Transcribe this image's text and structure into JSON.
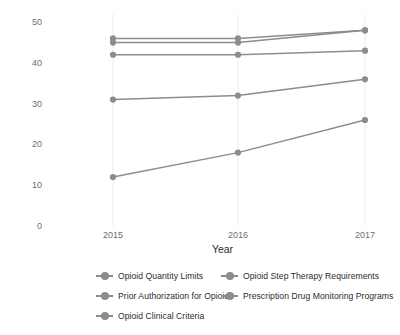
{
  "chart_data": {
    "type": "line",
    "title": "",
    "xlabel": "Year",
    "ylabel": "Number of states adopting policy",
    "x": [
      2015,
      2016,
      2017
    ],
    "xtick_labels": [
      "2015",
      "2016",
      "2017"
    ],
    "ytick_labels": [
      "0",
      "10",
      "20",
      "30",
      "40",
      "50"
    ],
    "ytick_values": [
      0,
      10,
      20,
      30,
      40,
      50
    ],
    "ylim": [
      0,
      52
    ],
    "grid": "vertical-only",
    "legend_position": "bottom",
    "legend_columns": 2,
    "series": [
      {
        "name": "Opioid Quantity Limits",
        "values": [
          46,
          46,
          48
        ],
        "color": "#8c8c8c"
      },
      {
        "name": "Opioid Step Therapy Requirements",
        "values": [
          45,
          45,
          48
        ],
        "color": "#8c8c8c"
      },
      {
        "name": "Prior Authorization for Opioids",
        "values": [
          42,
          42,
          43
        ],
        "color": "#8c8c8c"
      },
      {
        "name": "Prescription Drug Monitoring Programs",
        "values": [
          31,
          32,
          36
        ],
        "color": "#8c8c8c"
      },
      {
        "name": "Opioid Clinical Criteria",
        "values": [
          12,
          18,
          26
        ],
        "color": "#8c8c8c"
      }
    ]
  },
  "legend": {
    "items": [
      {
        "label": "Opioid Quantity Limits"
      },
      {
        "label": "Opioid Step Therapy Requirements"
      },
      {
        "label": "Prior Authorization for Opioids"
      },
      {
        "label": "Prescription Drug Monitoring Programs"
      },
      {
        "label": "Opioid Clinical Criteria"
      }
    ]
  },
  "colors": {
    "series": "#8c8c8c",
    "gridline": "#ebebeb",
    "tick_text": "#6e6e6e",
    "title_text": "#2b2b2b",
    "panel_background": "#ffffff"
  }
}
